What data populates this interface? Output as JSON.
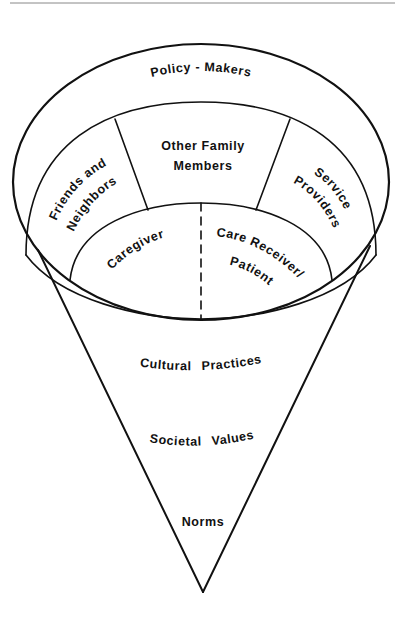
{
  "diagram": {
    "type": "cone-model",
    "colors": {
      "line": "#111111",
      "background": "#ffffff",
      "rule": "#888888"
    },
    "rings": {
      "outer": {
        "label": "Policy - Makers"
      },
      "middle": {
        "left": {
          "line1": "Friends and",
          "line2": "Neighbors"
        },
        "center": {
          "line1": "Other Family",
          "line2": "Members"
        },
        "right": {
          "line1": "Service",
          "line2": "Providers"
        }
      },
      "inner": {
        "left": {
          "label": "Caregiver"
        },
        "right": {
          "line1": "Care Receiver/",
          "line2": "Patient"
        }
      }
    },
    "cone": {
      "levels": [
        "Cultural Practices",
        "Societal Values",
        "Norms"
      ]
    }
  }
}
